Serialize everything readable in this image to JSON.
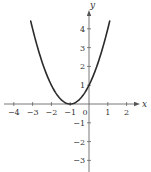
{
  "chart_data": {
    "type": "line",
    "title": "",
    "xlabel": "x",
    "ylabel": "y",
    "xlim": [
      -4.5,
      2.7
    ],
    "ylim": [
      -3.5,
      5.0
    ],
    "grid": false,
    "legend": null,
    "x_ticks": [
      -4,
      -3,
      -2,
      -1,
      0,
      1,
      2
    ],
    "x_tick_labels": [
      "−4",
      "−3",
      "−2",
      "−1",
      "0",
      "1",
      "2"
    ],
    "y_ticks": [
      -3,
      -2,
      -1,
      1,
      2,
      3,
      4
    ],
    "y_tick_labels": [
      "−3",
      "−2",
      "−1",
      "1",
      "2",
      "3",
      "4"
    ],
    "series": [
      {
        "name": "y = (x + 1)^2",
        "color": "#2b2b2b",
        "x": [
          -3.1,
          -3.0,
          -2.5,
          -2.0,
          -1.5,
          -1.0,
          -0.5,
          0.0,
          0.5,
          1.0,
          1.1
        ],
        "y": [
          4.41,
          4.0,
          2.25,
          1.0,
          0.25,
          0.0,
          0.25,
          1.0,
          2.25,
          4.0,
          4.41
        ]
      }
    ],
    "annotations": []
  },
  "layout": {
    "origin_px": [
      89,
      104
    ],
    "unit_px": 18.8,
    "axis_color": "#555555",
    "curve_color": "#2b2b2b"
  }
}
